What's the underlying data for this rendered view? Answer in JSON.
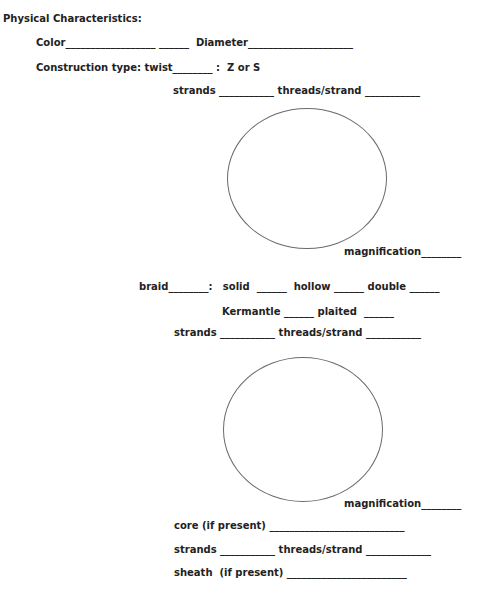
{
  "form": {
    "heading": "Physical Characteristics:",
    "color_row": "Color__________________ ______  Diameter_____________________",
    "construction_row": "Construction type: twist________ :  Z or S",
    "twist": {
      "strands_row": "strands ___________ threads/strand ___________",
      "magnification_row": "magnification________"
    },
    "braid": {
      "type_row": "braid________:   solid  ______  hollow ______ double ______",
      "kermantle_row": "Kermantle ______ plaited  ______",
      "strands_row": "strands ___________ threads/strand ___________",
      "magnification_row": "magnification________",
      "core_row": "core (if present) ___________________________",
      "core_strands_row": "strands ___________ threads/strand _____________",
      "sheath_row": "sheath  (if present) ________________________"
    }
  }
}
